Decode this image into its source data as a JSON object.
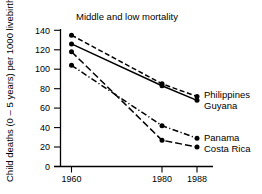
{
  "chart_data": {
    "type": "line",
    "title": "Middle and low mortality",
    "xlabel": "",
    "ylabel": "Child deaths (0 – 5 years) per 1000 livebirths",
    "x": [
      1960,
      1980,
      1988
    ],
    "xtick_labels": [
      "1960",
      "1980",
      "1988"
    ],
    "ytick_labels": [
      "0",
      "20",
      "40",
      "60",
      "80",
      "100",
      "120",
      "140"
    ],
    "ytick_values": [
      0,
      20,
      40,
      60,
      80,
      100,
      120,
      140
    ],
    "ylim": [
      0,
      140
    ],
    "xlim": [
      1956,
      1992
    ],
    "grid": false,
    "legend_position": "right-inline",
    "series": [
      {
        "name": "Philippines",
        "values": [
          135,
          85,
          72
        ],
        "line_style": "dashed",
        "marker": "filled-circle"
      },
      {
        "name": "Guyana",
        "values": [
          126,
          83,
          68
        ],
        "line_style": "solid",
        "marker": "filled-circle"
      },
      {
        "name": "Costa Rica",
        "values": [
          118,
          27,
          20
        ],
        "line_style": "long-dash",
        "marker": "filled-circle"
      },
      {
        "name": "Panama",
        "values": [
          104,
          42,
          29
        ],
        "line_style": "dash-dot",
        "marker": "filled-circle"
      }
    ],
    "colors": {
      "axis": "#000000",
      "series": "#000000",
      "background": "#ffffff"
    }
  },
  "labels": {
    "title": "Middle and low mortality",
    "y_axis_title": "Child deaths (0 – 5 years) per 1000 livebirths",
    "series_philippines": "Philippines",
    "series_guyana": "Guyana",
    "series_panama": "Panama",
    "series_costa_rica": "Costa Rica",
    "y_0": "0",
    "y_20": "20",
    "y_40": "40",
    "y_60": "60",
    "y_80": "80",
    "y_100": "100",
    "y_120": "120",
    "y_140": "140",
    "x_1960": "1960",
    "x_1980": "1980",
    "x_1988": "1988"
  }
}
